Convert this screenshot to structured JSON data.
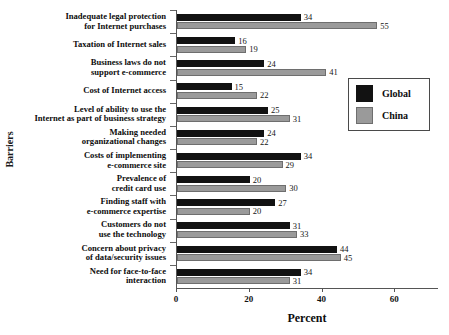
{
  "chart_data": {
    "type": "bar",
    "orientation": "horizontal",
    "title": "",
    "xlabel": "Percent",
    "ylabel": "Barriers",
    "xlim": [
      0,
      72
    ],
    "xticks": [
      0,
      20,
      40,
      60
    ],
    "grid": false,
    "legend_position": "right",
    "categories": [
      "Inadequate legal protection for Internet purchases",
      "Taxation of Internet sales",
      "Business laws do not support e-commerce",
      "Cost of Internet access",
      "Level of ability to use the Internet as part of business strategy",
      "Making needed organizational changes",
      "Costs of implementing e-commerce site",
      "Prevalence of credit card use",
      "Finding staff with e-commerce expertise",
      "Customers do not use the technology",
      "Concern about privacy of data/security issues",
      "Need for face-to-face interaction"
    ],
    "category_lines": [
      [
        "Inadequate legal protection",
        "for Internet purchases"
      ],
      [
        "Taxation of Internet sales"
      ],
      [
        "Business laws do not",
        "support e-commerce"
      ],
      [
        "Cost of Internet access"
      ],
      [
        "Level of ability to use the",
        "Internet as part of business strategy"
      ],
      [
        "Making needed",
        "organizational changes"
      ],
      [
        "Costs of implementing",
        "e-commerce site"
      ],
      [
        "Prevalence of",
        "credit card use"
      ],
      [
        "Finding staff with",
        "e-commerce expertise"
      ],
      [
        "Customers do not",
        "use the technology"
      ],
      [
        "Concern about privacy",
        "of data/security issues"
      ],
      [
        "Need for face-to-face",
        "interaction"
      ]
    ],
    "series": [
      {
        "name": "Global",
        "color": "#121212",
        "values": [
          34,
          16,
          24,
          15,
          25,
          24,
          34,
          20,
          27,
          31,
          44,
          34
        ]
      },
      {
        "name": "China",
        "color": "#9a9a9a",
        "values": [
          55,
          19,
          41,
          22,
          31,
          22,
          29,
          30,
          20,
          33,
          45,
          31
        ]
      }
    ]
  },
  "legend": {
    "entries": [
      {
        "label": "Global",
        "swatch": "global"
      },
      {
        "label": "China",
        "swatch": "china"
      }
    ]
  },
  "axes": {
    "x_title": "Percent",
    "y_title": "Barriers",
    "x_tick_labels": [
      "0",
      "20",
      "40",
      "60"
    ]
  }
}
